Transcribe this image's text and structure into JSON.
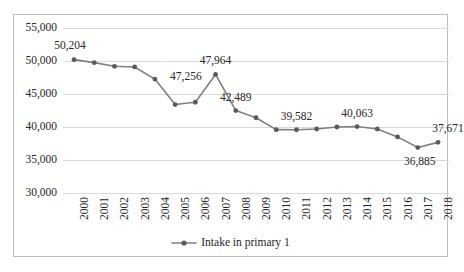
{
  "chart_data": {
    "type": "line",
    "title": "",
    "subtitle": "",
    "xlabel": "",
    "ylabel": "",
    "categories": [
      "2000",
      "2001",
      "2002",
      "2003",
      "2004",
      "2005",
      "2006",
      "2007",
      "2008",
      "2009",
      "2010",
      "2011",
      "2012",
      "2013",
      "2014",
      "2015",
      "2016",
      "2017",
      "2018"
    ],
    "series": [
      {
        "name": "Intake in primary 1",
        "color": "#808080",
        "marker": "circle",
        "values": [
          50204,
          49750,
          49200,
          49100,
          47256,
          43400,
          43750,
          47964,
          42489,
          41400,
          39600,
          39582,
          39700,
          40000,
          40063,
          39700,
          38500,
          36885,
          37671
        ]
      }
    ],
    "point_labels": [
      {
        "category": "2000",
        "value": 50204,
        "text": "50,204",
        "position": "above-left"
      },
      {
        "category": "2004",
        "value": 47256,
        "text": "47,256",
        "position": "right"
      },
      {
        "category": "2007",
        "value": 47964,
        "text": "47,964",
        "position": "above"
      },
      {
        "category": "2008",
        "value": 42489,
        "text": "42,489",
        "position": "above"
      },
      {
        "category": "2011",
        "value": 39582,
        "text": "39,582",
        "position": "above"
      },
      {
        "category": "2014",
        "value": 40063,
        "text": "40,063",
        "position": "above"
      },
      {
        "category": "2017",
        "value": 36885,
        "text": "36,885",
        "position": "below"
      },
      {
        "category": "2018",
        "value": 37671,
        "text": "37,671",
        "position": "above-right"
      }
    ],
    "yticks": [
      {
        "value": 55000,
        "label": "55,000"
      },
      {
        "value": 50000,
        "label": "50,000"
      },
      {
        "value": 45000,
        "label": "45,000"
      },
      {
        "value": 40000,
        "label": "40,000"
      },
      {
        "value": 35000,
        "label": "35,000"
      },
      {
        "value": 30000,
        "label": "30,000"
      }
    ],
    "ylim": [
      30000,
      55000
    ],
    "grid": true,
    "grid_axis": "y",
    "grid_color": "#d9d9d9",
    "legend": {
      "position": "bottom-center",
      "entries": [
        {
          "label": "Intake in primary 1",
          "color": "#808080",
          "marker": "circle"
        }
      ]
    },
    "border_color": "#bfbfbf",
    "background": "#ffffff",
    "xtick_rotation": -90
  }
}
